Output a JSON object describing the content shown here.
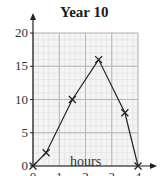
{
  "chart_data": {
    "type": "line",
    "title": "Year 10",
    "xlabel": "hours",
    "ylabel": "",
    "x": [
      0,
      0.5,
      1.5,
      2.5,
      3.5,
      4
    ],
    "series": [
      {
        "name": "Year 10",
        "values": [
          0,
          2,
          10,
          16,
          8,
          0
        ],
        "marker": "x"
      }
    ],
    "xticks": [
      "0",
      "1",
      "2",
      "3",
      "4"
    ],
    "yticks": [
      "0",
      "5",
      "10",
      "15",
      "20"
    ],
    "xlim": [
      0,
      4
    ],
    "ylim": [
      0,
      20
    ],
    "grid": true
  }
}
